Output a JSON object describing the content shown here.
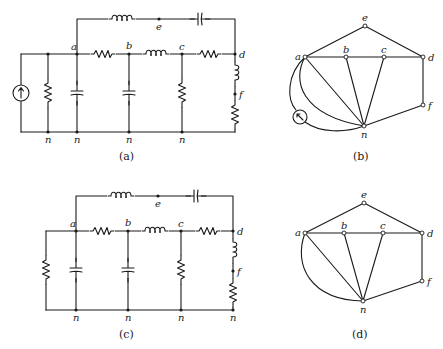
{
  "figure": {
    "panels": [
      {
        "id": "a",
        "caption": "(a)",
        "type": "circuit",
        "node_labels": {
          "a": "a",
          "b": "b",
          "c": "c",
          "d": "d",
          "e": "e",
          "f": "f",
          "n": "n"
        },
        "has_current_source": true
      },
      {
        "id": "b",
        "caption": "(b)",
        "type": "graph",
        "node_labels": {
          "a": "a",
          "b": "b",
          "c": "c",
          "d": "d",
          "e": "e",
          "f": "f",
          "n": "n"
        },
        "has_current_source": true
      },
      {
        "id": "c",
        "caption": "(c)",
        "type": "circuit",
        "node_labels": {
          "a": "a",
          "b": "b",
          "c": "c",
          "d": "d",
          "e": "e",
          "f": "f",
          "n": "n"
        },
        "has_current_source": false
      },
      {
        "id": "d",
        "caption": "(d)",
        "type": "graph",
        "node_labels": {
          "a": "a",
          "b": "b",
          "c": "c",
          "d": "d",
          "e": "e",
          "f": "f",
          "n": "n"
        },
        "has_current_source": false
      }
    ],
    "icons": {
      "current_source": "current-source-icon",
      "resistor": "resistor-icon",
      "inductor": "inductor-icon",
      "capacitor": "capacitor-icon"
    },
    "colors": {
      "ink": "#1a1a1a",
      "background": "#ffffff"
    }
  }
}
